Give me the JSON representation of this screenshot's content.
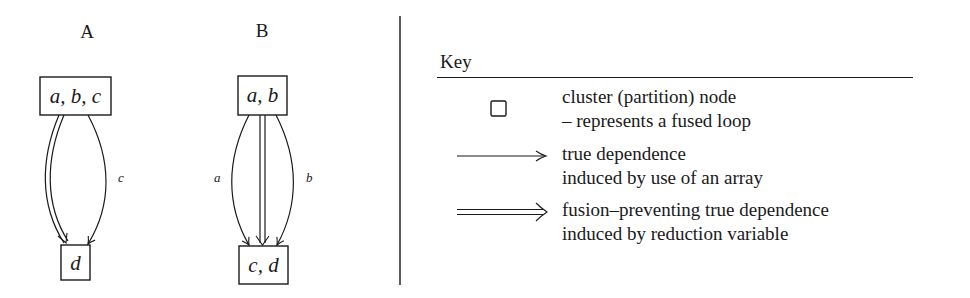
{
  "diagrams": [
    {
      "label": "A",
      "nodes": {
        "top": "a, b, c",
        "bottom": "d"
      },
      "edges": [
        {
          "type": "fusion-preventing",
          "label": ""
        },
        {
          "type": "true-dependence",
          "label": "c"
        }
      ]
    },
    {
      "label": "B",
      "nodes": {
        "top": "a, b",
        "bottom": "c, d"
      },
      "edges": [
        {
          "type": "true-dependence",
          "label": "a"
        },
        {
          "type": "fusion-preventing",
          "label": ""
        },
        {
          "type": "true-dependence",
          "label": "b"
        }
      ]
    }
  ],
  "key": {
    "title": "Key",
    "entries": [
      {
        "symbol": "square-node-icon",
        "lines": [
          "cluster (partition) node",
          "– represents a fused loop"
        ]
      },
      {
        "symbol": "single-arrow-icon",
        "lines": [
          "true dependence",
          "induced by use of an array"
        ]
      },
      {
        "symbol": "double-arrow-icon",
        "lines": [
          "fusion–preventing true dependence",
          "induced by reduction variable"
        ]
      }
    ]
  }
}
